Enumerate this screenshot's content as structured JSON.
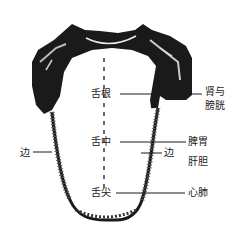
{
  "diagram": {
    "colors": {
      "ink": "#1a1a1a",
      "background": "#ffffff"
    },
    "labels": {
      "root": "舌根",
      "root_organs_line1": "肾与",
      "root_organs_line2": "膀胱",
      "middle": "舌中",
      "middle_organs": "脾胃",
      "edge_left": "边",
      "edge_right": "边",
      "edge_organs": "肝胆",
      "tip": "舌尖",
      "tip_organs": "心肺"
    }
  }
}
